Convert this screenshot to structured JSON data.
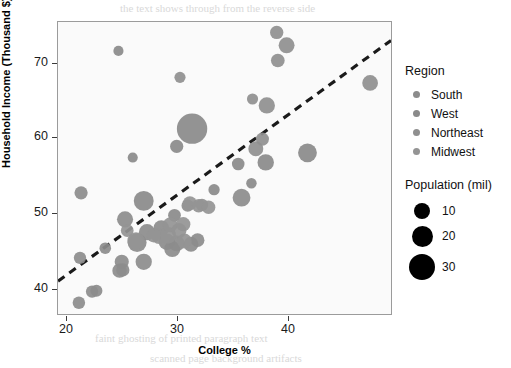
{
  "chart_data": {
    "type": "scatter",
    "title": "",
    "xlabel": "College %",
    "ylabel": "Household Income (Thousand $)",
    "xlim": [
      19.2,
      49.5
    ],
    "ylim": [
      37.8,
      74.2
    ],
    "xticks": [
      20,
      30,
      40
    ],
    "yticks": [
      40,
      50,
      60,
      70
    ],
    "grid": false,
    "bubble_size_field": "Population (mil)",
    "color_field": "Region",
    "legend_position": "right",
    "trendline": {
      "type": "dashed-linear",
      "x_start": 19.2,
      "y_start": 41.9,
      "x_end": 49.5,
      "y_end": 71.9,
      "color": "#1a1a1a",
      "dash": "8 6",
      "width": 3.2
    },
    "series": [
      {
        "name": "South",
        "color": "#8c8c8c",
        "points": [
          {
            "x": 21.1,
            "y": 39.2,
            "pop": 3.0
          },
          {
            "x": 21.3,
            "y": 52.9,
            "pop": 3.6
          },
          {
            "x": 21.2,
            "y": 44.8,
            "pop": 2.9
          },
          {
            "x": 22.3,
            "y": 40.6,
            "pop": 2.9
          },
          {
            "x": 22.7,
            "y": 40.7,
            "pop": 2.6
          },
          {
            "x": 23.5,
            "y": 46.0,
            "pop": 2.4
          },
          {
            "x": 24.8,
            "y": 43.2,
            "pop": 4.6
          },
          {
            "x": 25.0,
            "y": 44.3,
            "pop": 4.4
          },
          {
            "x": 25.1,
            "y": 43.3,
            "pop": 3.6
          },
          {
            "x": 25.3,
            "y": 49.6,
            "pop": 6.3
          },
          {
            "x": 26.4,
            "y": 46.7,
            "pop": 9.7
          },
          {
            "x": 27.0,
            "y": 44.3,
            "pop": 6.5
          },
          {
            "x": 27.3,
            "y": 48.0,
            "pop": 6.4
          },
          {
            "x": 28.6,
            "y": 48.5,
            "pop": 5.9
          },
          {
            "x": 29.1,
            "y": 46.8,
            "pop": 6.6
          },
          {
            "x": 29.6,
            "y": 45.9,
            "pop": 6.3
          },
          {
            "x": 30.0,
            "y": 46.6,
            "pop": 6.0
          },
          {
            "x": 31.3,
            "y": 46.5,
            "pop": 5.1
          },
          {
            "x": 31.9,
            "y": 47.0,
            "pop": 4.0
          },
          {
            "x": 35.9,
            "y": 52.3,
            "pop": 8.3
          },
          {
            "x": 31.0,
            "y": 51.3,
            "pop": 2.9
          }
        ]
      },
      {
        "name": "West",
        "color": "#8a8a8a",
        "points": [
          {
            "x": 24.7,
            "y": 70.6,
            "pop": 1.5
          },
          {
            "x": 26.0,
            "y": 57.3,
            "pop": 1.5
          },
          {
            "x": 27.0,
            "y": 51.9,
            "pop": 11.0
          },
          {
            "x": 31.4,
            "y": 60.9,
            "pop": 31.0
          },
          {
            "x": 30.0,
            "y": 58.7,
            "pop": 3.6
          },
          {
            "x": 33.4,
            "y": 53.3,
            "pop": 2.2
          },
          {
            "x": 35.6,
            "y": 56.5,
            "pop": 3.1
          },
          {
            "x": 36.8,
            "y": 54.1,
            "pop": 1.7
          },
          {
            "x": 38.1,
            "y": 56.7,
            "pop": 6.6
          },
          {
            "x": 41.9,
            "y": 57.9,
            "pop": 9.5
          },
          {
            "x": 29.8,
            "y": 50.1,
            "pop": 3.2
          }
        ]
      },
      {
        "name": "Northeast",
        "color": "#8f8f8f",
        "points": [
          {
            "x": 32.3,
            "y": 51.4,
            "pop": 3.0
          },
          {
            "x": 36.9,
            "y": 64.6,
            "pop": 2.1
          },
          {
            "x": 37.2,
            "y": 58.4,
            "pop": 5.1
          },
          {
            "x": 37.8,
            "y": 59.6,
            "pop": 3.5
          },
          {
            "x": 38.2,
            "y": 63.8,
            "pop": 6.5
          },
          {
            "x": 39.2,
            "y": 69.4,
            "pop": 4.0
          },
          {
            "x": 39.1,
            "y": 72.9,
            "pop": 3.7
          },
          {
            "x": 40.0,
            "y": 71.3,
            "pop": 6.1
          },
          {
            "x": 47.6,
            "y": 66.6,
            "pop": 5.9
          },
          {
            "x": 30.3,
            "y": 67.3,
            "pop": 2.1
          }
        ]
      },
      {
        "name": "Midwest",
        "color": "#949494",
        "points": [
          {
            "x": 25.5,
            "y": 48.2,
            "pop": 3.2
          },
          {
            "x": 26.3,
            "y": 46.9,
            "pop": 7.8
          },
          {
            "x": 28.4,
            "y": 47.5,
            "pop": 5.6
          },
          {
            "x": 29.2,
            "y": 47.6,
            "pop": 6.9
          },
          {
            "x": 29.4,
            "y": 48.9,
            "pop": 5.0
          },
          {
            "x": 30.2,
            "y": 48.2,
            "pop": 5.3
          },
          {
            "x": 30.7,
            "y": 46.9,
            "pop": 5.0
          },
          {
            "x": 31.2,
            "y": 51.6,
            "pop": 4.2
          },
          {
            "x": 32.0,
            "y": 51.3,
            "pop": 3.8
          },
          {
            "x": 32.9,
            "y": 51.1,
            "pop": 3.9
          },
          {
            "x": 30.6,
            "y": 49.0,
            "pop": 4.4
          },
          {
            "x": 27.9,
            "y": 47.6,
            "pop": 4.3
          }
        ]
      }
    ]
  },
  "axes": {
    "x_title": "College %",
    "y_title": "Household Income (Thousand $)",
    "x_tick_labels": [
      "20",
      "30",
      "40"
    ],
    "y_tick_labels": [
      "70",
      "60",
      "50",
      "40"
    ]
  },
  "legend_region": {
    "title": "Region",
    "items": [
      {
        "label": "South",
        "color": "#8c8c8c"
      },
      {
        "label": "West",
        "color": "#8a8a8a"
      },
      {
        "label": "Northeast",
        "color": "#8f8f8f"
      },
      {
        "label": "Midwest",
        "color": "#949494"
      }
    ]
  },
  "legend_size": {
    "title": "Population (mil)",
    "items": [
      {
        "label": "10",
        "radius": 8
      },
      {
        "label": "20",
        "radius": 10.5
      },
      {
        "label": "30",
        "radius": 13
      }
    ]
  },
  "bleed_text": {
    "lines": [
      "the text shows through from the reverse side",
      "faint ghosting of printed paragraph text",
      "scanned page background artifacts",
      "lorem ipsum shows through the page"
    ]
  }
}
